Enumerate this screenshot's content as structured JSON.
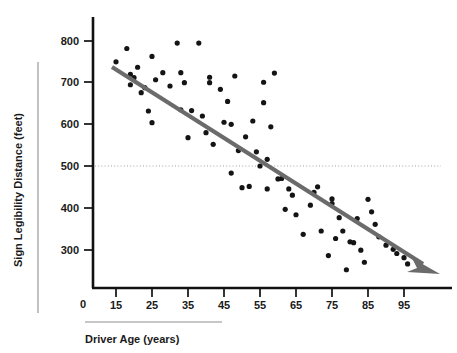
{
  "figure": {
    "background": "#ffffff",
    "point_color": "#141414",
    "trend_color": "#6b6b6b",
    "axis_color": "#111111",
    "ref_line_color": "#9a9a9a"
  },
  "labels": {
    "y_axis_title": "Sign Legibility Distance (feet)",
    "x_axis_title": "Driver Age (years)",
    "origin_label": "0"
  },
  "chart_data": {
    "type": "scatter",
    "title": "",
    "xlabel": "Driver Age (years)",
    "ylabel": "Sign Legibility Distance (feet)",
    "xlim": [
      5,
      105
    ],
    "ylim": [
      200,
      830
    ],
    "xticks": [
      15,
      25,
      35,
      45,
      55,
      65,
      75,
      85,
      95
    ],
    "yticks": [
      300,
      400,
      500,
      600,
      700,
      800
    ],
    "ytick_origin": "0",
    "grid": false,
    "legend": null,
    "reference_lines": [
      {
        "axis": "y",
        "value": 500,
        "style": "dotted",
        "color": "#9a9a9a"
      }
    ],
    "annotations": [
      {
        "type": "trend-arrow",
        "from": [
          13,
          726
        ],
        "to": [
          104,
          258
        ],
        "color": "#6b6b6b",
        "description": "downward sloping regression arrow"
      }
    ],
    "series": [
      {
        "name": "Drivers",
        "x": [
          15,
          18,
          19,
          19,
          20,
          21,
          22,
          23,
          24,
          25,
          25,
          26,
          28,
          30,
          32,
          33,
          33,
          34,
          35,
          36,
          38,
          39,
          40,
          41,
          41,
          42,
          44,
          45,
          46,
          47,
          47,
          48,
          49,
          50,
          51,
          52,
          53,
          54,
          55,
          56,
          56,
          57,
          57,
          58,
          59,
          60,
          61,
          62,
          63,
          64,
          65,
          67,
          69,
          70,
          71,
          72,
          74,
          75,
          75,
          76,
          77,
          78,
          79,
          80,
          81,
          82,
          83,
          84,
          85,
          86,
          87,
          88,
          90,
          92,
          93,
          95,
          96
        ],
        "y": [
          750,
          782,
          695,
          720,
          712,
          737,
          676,
          688,
          632,
          604,
          763,
          707,
          724,
          692,
          795,
          635,
          724,
          700,
          568,
          633,
          795,
          620,
          580,
          700,
          713,
          552,
          684,
          605,
          655,
          483,
          600,
          716,
          537,
          448,
          570,
          451,
          608,
          534,
          500,
          701,
          652,
          445,
          516,
          594,
          723,
          469,
          470,
          396,
          445,
          430,
          383,
          336,
          406,
          437,
          450,
          344,
          285,
          410,
          421,
          326,
          376,
          344,
          251,
          318,
          316,
          374,
          298,
          269,
          420,
          390,
          360,
          330,
          310,
          300,
          290,
          280,
          265
        ]
      }
    ]
  }
}
